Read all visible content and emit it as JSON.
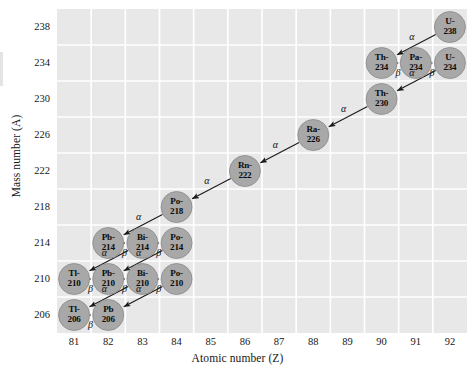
{
  "chart_data": {
    "type": "scatter",
    "title": "",
    "xlabel": "Atomic number (Z)",
    "ylabel": "Mass number (A)",
    "xlim": [
      80.5,
      92.5
    ],
    "ylim": [
      204,
      240
    ],
    "xticks": [
      81,
      82,
      83,
      84,
      85,
      86,
      87,
      88,
      89,
      90,
      91,
      92
    ],
    "yticks": [
      206,
      210,
      214,
      218,
      222,
      226,
      230,
      234,
      238
    ],
    "grid": true,
    "legend": "none",
    "nodes": [
      {
        "id": "U-238",
        "line1": "U-",
        "line2": "238",
        "z": 92,
        "a": 238
      },
      {
        "id": "Th-234",
        "line1": "Th-",
        "line2": "234",
        "z": 90,
        "a": 234
      },
      {
        "id": "Pa-234",
        "line1": "Pa-",
        "line2": "234",
        "z": 91,
        "a": 234
      },
      {
        "id": "U-234",
        "line1": "U-",
        "line2": "234",
        "z": 92,
        "a": 234
      },
      {
        "id": "Th-230",
        "line1": "Th-",
        "line2": "230",
        "z": 90,
        "a": 230
      },
      {
        "id": "Ra-226",
        "line1": "Ra-",
        "line2": "226",
        "z": 88,
        "a": 226
      },
      {
        "id": "Rn-222",
        "line1": "Rn-",
        "line2": "222",
        "z": 86,
        "a": 222
      },
      {
        "id": "Po-218",
        "line1": "Po-",
        "line2": "218",
        "z": 84,
        "a": 218
      },
      {
        "id": "Pb-214",
        "line1": "Pb-",
        "line2": "214",
        "z": 82,
        "a": 214
      },
      {
        "id": "Bi-214",
        "line1": "Bi-",
        "line2": "214",
        "z": 83,
        "a": 214
      },
      {
        "id": "Po-214",
        "line1": "Po-",
        "line2": "214",
        "z": 84,
        "a": 214
      },
      {
        "id": "Tl-210",
        "line1": "Tl-",
        "line2": "210",
        "z": 81,
        "a": 210
      },
      {
        "id": "Pb-210",
        "line1": "Pb-",
        "line2": "210",
        "z": 82,
        "a": 210
      },
      {
        "id": "Bi-210",
        "line1": "Bi-",
        "line2": "210",
        "z": 83,
        "a": 210
      },
      {
        "id": "Po-210",
        "line1": "Po-",
        "line2": "210",
        "z": 84,
        "a": 210
      },
      {
        "id": "Tl-206",
        "line1": "Tl-",
        "line2": "206",
        "z": 81,
        "a": 206
      },
      {
        "id": "Pb-206",
        "line1": "Pb",
        "line2": "206",
        "z": 82,
        "a": 206
      }
    ],
    "decays": [
      {
        "from": "U-238",
        "to": "Th-234",
        "type": "alpha",
        "label": "α"
      },
      {
        "from": "Th-234",
        "to": "Pa-234",
        "type": "beta",
        "label": "β"
      },
      {
        "from": "Pa-234",
        "to": "U-234",
        "type": "beta",
        "label": "β"
      },
      {
        "from": "U-234",
        "to": "Th-230",
        "type": "alpha",
        "label": "α"
      },
      {
        "from": "Th-230",
        "to": "Ra-226",
        "type": "alpha",
        "label": "α"
      },
      {
        "from": "Ra-226",
        "to": "Rn-222",
        "type": "alpha",
        "label": "α"
      },
      {
        "from": "Rn-222",
        "to": "Po-218",
        "type": "alpha",
        "label": "α"
      },
      {
        "from": "Po-218",
        "to": "Pb-214",
        "type": "alpha",
        "label": "α"
      },
      {
        "from": "Pb-214",
        "to": "Bi-214",
        "type": "beta",
        "label": "β"
      },
      {
        "from": "Bi-214",
        "to": "Po-214",
        "type": "beta",
        "label": "β"
      },
      {
        "from": "Bi-214",
        "to": "Tl-210",
        "type": "alpha",
        "label": "α"
      },
      {
        "from": "Po-214",
        "to": "Pb-210",
        "type": "alpha",
        "label": "α"
      },
      {
        "from": "Tl-210",
        "to": "Pb-210",
        "type": "beta",
        "label": "β"
      },
      {
        "from": "Pb-210",
        "to": "Bi-210",
        "type": "beta",
        "label": "β"
      },
      {
        "from": "Bi-210",
        "to": "Po-210",
        "type": "beta",
        "label": "β"
      },
      {
        "from": "Bi-210",
        "to": "Tl-206",
        "type": "alpha",
        "label": "α"
      },
      {
        "from": "Po-210",
        "to": "Pb-206",
        "type": "alpha",
        "label": "α"
      },
      {
        "from": "Tl-206",
        "to": "Pb-206",
        "type": "beta",
        "label": "β"
      }
    ]
  },
  "colors": {
    "plot_background": "#e8e8e8",
    "gridline": "#ffffff",
    "node_fill": "#a8a8a8",
    "node_stroke": "#8a8a8a",
    "arrow": "#1a1a1a",
    "text": "#121212"
  }
}
